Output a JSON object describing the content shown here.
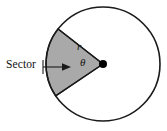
{
  "figure": {
    "labels": {
      "sector": "Sector",
      "radius": "r",
      "angle": "θ"
    },
    "colors": {
      "sector_fill": "#a9a9a9",
      "outline": "#1a1a1a",
      "background": "#ffffff",
      "center_dot": "#000000",
      "text": "#111111"
    },
    "geometry": {
      "center_x": 103,
      "center_y": 64,
      "radius": 57,
      "sector_start_angle_deg": 142,
      "sector_end_angle_deg": 214,
      "center_dot_radius": 4,
      "outline_width": 1.6
    },
    "leader": {
      "from_x": 43,
      "from_y": 67,
      "to_x": 69,
      "to_y": 67,
      "tick_x": 43,
      "tick_top_y": 60,
      "tick_bottom_y": 74
    }
  },
  "chart_data": {
    "type": "diagram",
    "elements": [
      {
        "name": "circle",
        "center": [
          103,
          64
        ],
        "radius": 57,
        "stroke": "#1a1a1a",
        "fill": "none"
      },
      {
        "name": "sector",
        "center": [
          103,
          64
        ],
        "radius": 57,
        "start_angle_deg": 142,
        "end_angle_deg": 214,
        "fill": "#a9a9a9",
        "stroke": "#1a1a1a"
      },
      {
        "name": "center-point",
        "position": [
          103,
          64
        ],
        "fill": "#000000"
      },
      {
        "name": "radius-line",
        "from": [
          103,
          64
        ],
        "to": [
          58,
          29
        ],
        "label": "r"
      },
      {
        "name": "angle-arc",
        "at": [
          103,
          64
        ],
        "label": "θ"
      },
      {
        "name": "leader-arrow",
        "from": [
          43,
          67
        ],
        "to": [
          69,
          67
        ],
        "label": "Sector"
      }
    ],
    "annotations": [
      "Sector",
      "r",
      "θ"
    ]
  }
}
